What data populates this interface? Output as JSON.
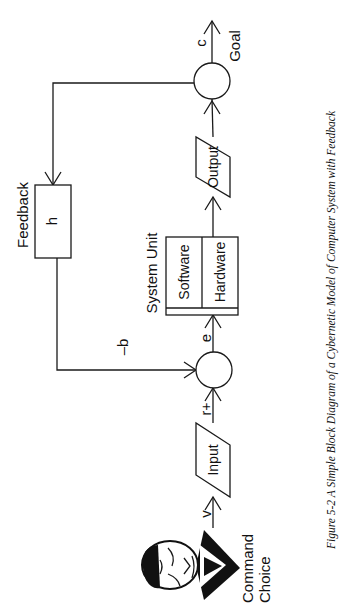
{
  "figure": {
    "caption": "Figure 5-2  A Simple Block Diagram of a Cybernetic Model of Computer System with Feedback",
    "orientation": "rotated 90° counter-clockwise (landscape page)"
  },
  "nodes": {
    "operator": {
      "label_line1": "Command",
      "label_line2": "Choice",
      "icon": "person-face-icon"
    },
    "input_block": {
      "label": "Input",
      "shape": "parallelogram"
    },
    "summing_junction": {
      "shape": "circle"
    },
    "system_unit": {
      "title": "System Unit",
      "left_compartment": "Software",
      "right_compartment": "Hardware"
    },
    "output_block": {
      "label": "Output",
      "shape": "parallelogram"
    },
    "output_junction": {
      "shape": "circle"
    },
    "feedback_block": {
      "title": "Feedback",
      "label": "h"
    },
    "goal": {
      "label": "Goal"
    }
  },
  "signals": {
    "v": "v",
    "r": "r+",
    "e": "e",
    "b": "–b",
    "c": "c"
  },
  "colors": {
    "ink": "#1a1a1a",
    "background": "#ffffff"
  }
}
